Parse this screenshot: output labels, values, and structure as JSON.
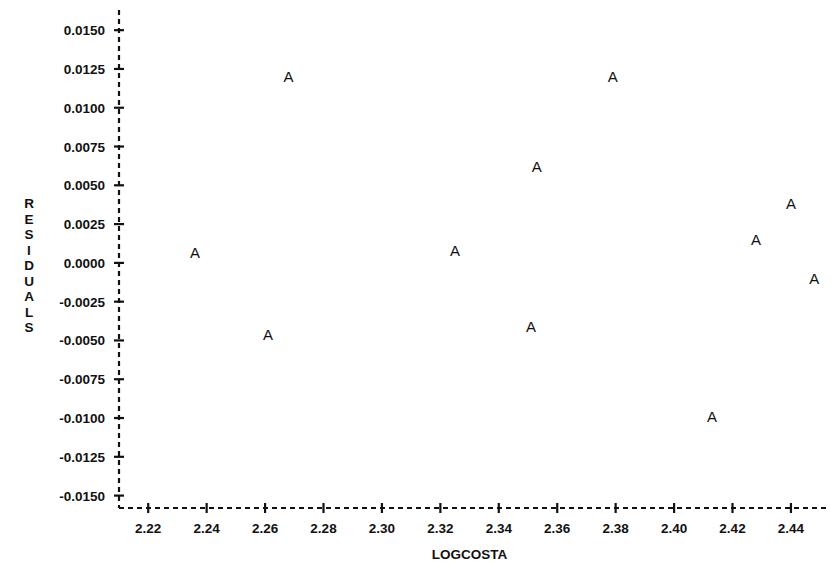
{
  "chart_data": {
    "type": "scatter",
    "title": "",
    "xlabel": "LOGCOSTA",
    "ylabel": "RESIDUALS",
    "marker_symbol": "A",
    "grid": false,
    "legend": null,
    "xlim": [
      2.21,
      2.452
    ],
    "ylim": [
      -0.0158,
      0.0163
    ],
    "xticks": [
      2.22,
      2.24,
      2.26,
      2.28,
      2.3,
      2.32,
      2.34,
      2.36,
      2.38,
      2.4,
      2.42,
      2.44
    ],
    "xtick_labels": [
      "2.22",
      "2.24",
      "2.26",
      "2.28",
      "2.30",
      "2.32",
      "2.34",
      "2.36",
      "2.38",
      "2.40",
      "2.42",
      "2.44"
    ],
    "yticks": [
      0.015,
      0.0125,
      0.01,
      0.0075,
      0.005,
      0.0025,
      0.0,
      -0.0025,
      -0.005,
      -0.0075,
      -0.01,
      -0.0125,
      -0.015
    ],
    "ytick_labels": [
      "0.0150",
      "0.0125",
      "0.0100",
      "0.0075",
      "0.0050",
      "0.0025",
      "0.0000",
      "-0.0025",
      "-0.0050",
      "-0.0075",
      "-0.0100",
      "-0.0125",
      "-0.0150"
    ],
    "points": [
      {
        "x": 2.236,
        "y": 0.0007,
        "label": "A"
      },
      {
        "x": 2.261,
        "y": -0.0046,
        "label": "A"
      },
      {
        "x": 2.268,
        "y": 0.012,
        "label": "A"
      },
      {
        "x": 2.325,
        "y": 0.0008,
        "label": "A"
      },
      {
        "x": 2.351,
        "y": -0.0041,
        "label": "A"
      },
      {
        "x": 2.353,
        "y": 0.0062,
        "label": "A"
      },
      {
        "x": 2.379,
        "y": 0.012,
        "label": "A"
      },
      {
        "x": 2.413,
        "y": -0.0099,
        "label": "A"
      },
      {
        "x": 2.428,
        "y": 0.0015,
        "label": "A"
      },
      {
        "x": 2.44,
        "y": 0.0038,
        "label": "A"
      },
      {
        "x": 2.448,
        "y": -0.001,
        "label": "A"
      }
    ]
  },
  "axes": {
    "y_title_letters": "R\nE\nS\nI\nD\nU\nA\nL\nS",
    "x_title": "LOGCOSTA"
  },
  "style": {
    "foreground": "#111111",
    "background": "#ffffff"
  }
}
